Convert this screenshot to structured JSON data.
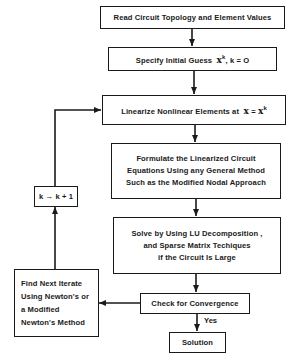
{
  "diagram": {
    "type": "flowchart",
    "nodes": {
      "read": {
        "lines": [
          "Read Circuit Topology and Element Values"
        ]
      },
      "guess": {
        "prefix": "Specify Initial Guess",
        "vector": "x",
        "superscript": "k",
        "suffix": ",  k = O"
      },
      "linearize": {
        "prefix": "Linearize Nonlinear Elements at",
        "vector_lhs": "x",
        "equals": "=",
        "vector_rhs": "x",
        "superscript": "k"
      },
      "formulate": {
        "lines": [
          "Formulate the Linearized Circuit",
          "Equations Using any General Method",
          "Such as the Modified Nodal Approach"
        ]
      },
      "solve": {
        "lines": [
          "Solve by Using LU Decomposition ,",
          "and Sparse Matrix Techiques",
          "if the Circuit Is Large"
        ]
      },
      "check": {
        "lines": [
          "Check for Convergence"
        ]
      },
      "solution": {
        "lines": [
          "Solution"
        ]
      },
      "increment": {
        "lines": [
          "k → k + 1"
        ]
      },
      "next_iterate": {
        "lines": [
          "Find Next Iterate",
          "Using Newton's or",
          "a Modified",
          "Newton's Method"
        ]
      }
    },
    "edges": [
      {
        "from": "read",
        "to": "guess"
      },
      {
        "from": "guess",
        "to": "linearize"
      },
      {
        "from": "linearize",
        "to": "formulate"
      },
      {
        "from": "formulate",
        "to": "solve"
      },
      {
        "from": "solve",
        "to": "check"
      },
      {
        "from": "check",
        "to": "solution",
        "label": "Yes"
      },
      {
        "from": "check",
        "to": "next_iterate"
      },
      {
        "from": "next_iterate",
        "to": "increment"
      },
      {
        "from": "increment",
        "to": "linearize"
      }
    ],
    "edge_labels": {
      "yes": "Yes"
    },
    "colors": {
      "stroke": "#1a1a1a",
      "background": "#ffffff"
    }
  }
}
